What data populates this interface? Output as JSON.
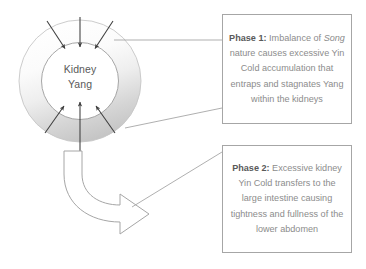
{
  "diagram": {
    "center_label": {
      "line1": "Kidney",
      "line2": "Yang"
    },
    "colors": {
      "ring_light": "#fdfdfd",
      "ring_dark": "#c9c9c9",
      "ring_stroke": "#bfbfbf",
      "inner_fill": "#ffffff",
      "arrow_stroke": "#404040",
      "block_arrow_stroke": "#a6a6a6",
      "box_border": "#a6a6a6",
      "text_gray": "#8c8c8c",
      "label_gray": "#595959",
      "connector": "#a6a6a6"
    },
    "arrows": {
      "inward_count": 6,
      "top_arrow_count": 3,
      "bottom_arrow_count": 3,
      "vertical_double_arrow": true,
      "block_arrow_direction": "curved-right-down"
    }
  },
  "phase1": {
    "label": "Phase 1",
    "colon": ":",
    "text_part1": " Imbalance of ",
    "text_italic": "Song",
    "text_part2": " nature causes excessive Yin Cold accumulation that entraps and stagnates Yang within the kidneys",
    "full_text": "Phase 1: Imbalance of Song nature causes excessive Yin Cold accumulation that entraps and stagnates Yang within the kidneys"
  },
  "phase2": {
    "label": "Phase 2",
    "colon": ":",
    "text": " Excessive kidney Yin Cold transfers to the large intestine causing tightness and fullness of the lower abdomen",
    "full_text": "Phase 2: Excessive kidney Yin Cold transfers to the large intestine causing tightness and fullness of the lower abdomen"
  }
}
